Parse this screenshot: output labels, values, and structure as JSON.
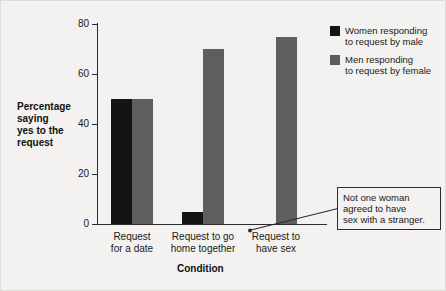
{
  "chart_data": {
    "type": "bar",
    "title": "",
    "xlabel": "Condition",
    "ylabel": "Percentage saying yes to the request",
    "ylim": [
      0,
      80
    ],
    "yticks": [
      0,
      20,
      40,
      60,
      80
    ],
    "grid": false,
    "legend_position": "top-right",
    "categories": [
      "Request for a date",
      "Request to go home together",
      "Request to have sex"
    ],
    "category_lines": [
      [
        "Request",
        "for a date"
      ],
      [
        "Request to go",
        "home together"
      ],
      [
        "Request to",
        "have sex"
      ]
    ],
    "series": [
      {
        "name": "Women responding to request by male",
        "name_lines": [
          "Women responding",
          "to request by male"
        ],
        "color": "#141414",
        "values": [
          50,
          5,
          0
        ]
      },
      {
        "name": "Men responding to request by female",
        "name_lines": [
          "Men responding",
          "to request by female"
        ],
        "color": "#5e5e5e",
        "values": [
          50,
          70,
          75
        ]
      }
    ],
    "annotations": [
      {
        "text": "Not one woman agreed to have sex with a stranger.",
        "lines": [
          "Not one woman",
          "agreed to have",
          "sex with a stranger."
        ],
        "points_to": {
          "category": "Request to have sex",
          "series": "Women responding to request by male",
          "value": 0
        }
      }
    ]
  },
  "axis": {
    "tick_0": "0",
    "tick_20": "20",
    "tick_40": "40",
    "tick_60": "60",
    "tick_80": "80"
  },
  "ylabel_lines": {
    "l1": "Percentage",
    "l2": "saying",
    "l3": "yes to the",
    "l4": "request"
  }
}
